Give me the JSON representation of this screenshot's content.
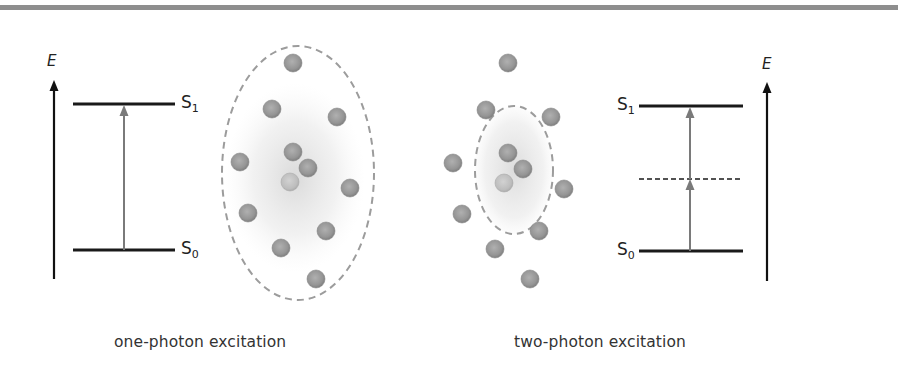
{
  "figure": {
    "panels": [
      {
        "id": "one-photon",
        "caption": "one-photon excitation",
        "energy_axis_label": "E",
        "levels": [
          {
            "label": "S",
            "sub": "1"
          },
          {
            "label": "S",
            "sub": "0"
          }
        ],
        "has_virtual_level": false,
        "molecule_count": 12,
        "excitation_volume": "large"
      },
      {
        "id": "two-photon",
        "caption": "two-photon excitation",
        "energy_axis_label": "E",
        "levels": [
          {
            "label": "S",
            "sub": "1"
          },
          {
            "label": "S",
            "sub": "0"
          }
        ],
        "has_virtual_level": true,
        "molecule_count": 12,
        "excitation_volume": "small"
      }
    ],
    "colors": {
      "level_line": "#1a1a1a",
      "transition_arrow": "#7a7a7a",
      "molecule": "#9a9a9a",
      "molecule_excited": "#c2c2c2",
      "ellipse_dash": "#9c9c9c",
      "top_rule": "#8e8e8e"
    }
  }
}
